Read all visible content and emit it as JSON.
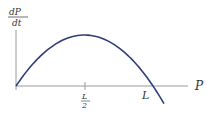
{
  "chart_data": {
    "type": "line",
    "title": "",
    "ylabel_numerator": "dP",
    "ylabel_denominator": "dt",
    "xlabel": "P",
    "x_ticks": [
      {
        "value": 0.5,
        "numerator": "L",
        "denominator": "2"
      },
      {
        "value": 1.0,
        "label": "L"
      }
    ],
    "xlim": [
      0,
      1.2
    ],
    "curve": "parabola dP/dt = k·P·(1 − P/L), zero at P=0 and P=L, max at P=L/2, continuing negative beyond L",
    "series": [
      {
        "name": "dP/dt",
        "x": [
          0,
          0.1,
          0.2,
          0.3,
          0.4,
          0.5,
          0.6,
          0.7,
          0.8,
          0.9,
          1.0,
          1.08
        ],
        "y": [
          0,
          0.36,
          0.64,
          0.84,
          0.96,
          1.0,
          0.96,
          0.84,
          0.64,
          0.36,
          0,
          -0.35
        ]
      }
    ],
    "colors": {
      "curve": "#2f3e7a",
      "axis": "#999999",
      "text": "#333333"
    }
  }
}
